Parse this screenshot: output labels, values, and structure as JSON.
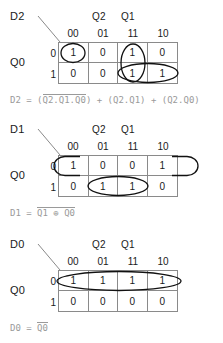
{
  "column_variables": {
    "left": "Q2",
    "right": "Q1"
  },
  "row_variable": "Q0",
  "column_headers": [
    "00",
    "01",
    "11",
    "10"
  ],
  "row_headers": [
    "0",
    "1"
  ],
  "maps": [
    {
      "name": "D2",
      "cells": [
        [
          "1",
          "0",
          "1",
          "0"
        ],
        [
          "0",
          "0",
          "1",
          "1"
        ]
      ],
      "equation": {
        "lhs": "D2",
        "eq": "=",
        "terms": [
          {
            "open": "(",
            "bar": "Q2.Q1.Q0",
            "close": ")"
          },
          {
            "open": "(",
            "plain": "Q2.Q1",
            "close": ")"
          },
          {
            "open": "(",
            "plain": "Q2.Q0",
            "close": ")"
          }
        ],
        "plus": "+",
        "full_text": "D2 = (Q2.Q1.Q0) + (Q2.Q1) + (Q2.Q0)"
      }
    },
    {
      "name": "D1",
      "cells": [
        [
          "1",
          "0",
          "0",
          "1"
        ],
        [
          "0",
          "1",
          "1",
          "0"
        ]
      ],
      "equation": {
        "lhs": "D1",
        "eq": "=",
        "bar": "Q1 ⊕ Q0",
        "full_text": "D1 = Q1 ⊕ Q0"
      }
    },
    {
      "name": "D0",
      "cells": [
        [
          "1",
          "1",
          "1",
          "1"
        ],
        [
          "0",
          "0",
          "0",
          "0"
        ]
      ],
      "equation": {
        "lhs": "D0",
        "eq": "=",
        "bar": "Q0",
        "full_text": "D0 = Q0"
      }
    }
  ],
  "colors": {
    "grid_line": "#8a8a8a",
    "text": "#1a1a1a",
    "equation_text": "#9a9a9a",
    "group_outline": "#111111",
    "background": "#ffffff"
  }
}
